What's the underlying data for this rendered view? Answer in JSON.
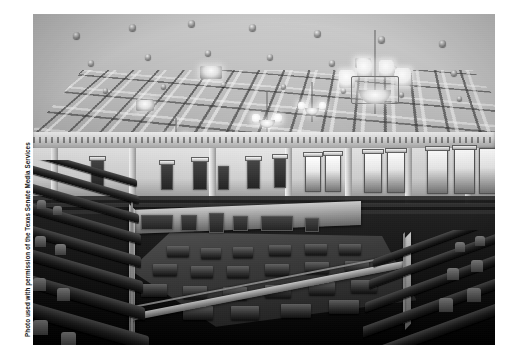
{
  "page": {
    "background_color": "#ffffff",
    "width": 518,
    "height": 362
  },
  "credit": {
    "text": "Photo used with permission of the Texas Senate Media Services",
    "orientation": "vertical-bottom-to-top",
    "color": "#1b1b1b"
  },
  "photo": {
    "alt": "Interior of the Texas Senate Chamber viewed from the upper gallery",
    "tone": "black-and-white",
    "frame": {
      "x": 33,
      "y": 14,
      "width": 462,
      "height": 331
    },
    "regions": [
      {
        "name": "coffered-ceiling",
        "description": "Deep coffered ceiling with ornamental beams and rosette bosses"
      },
      {
        "name": "chandeliers",
        "description": "Hanging chandeliers with frosted glass globes"
      },
      {
        "name": "upper-wall",
        "description": "Pale upper wall with arched windows and paneled doorways"
      },
      {
        "name": "back-gallery-tiers",
        "description": "Tiered gallery seating along the rear wall"
      },
      {
        "name": "senate-floor",
        "description": "Chamber well with rows of member desks"
      },
      {
        "name": "gallery-railing",
        "description": "Railing and parapet ringing the gallery"
      },
      {
        "name": "foreground-seating",
        "description": "Dark gallery seats in the foreground, left and right banks"
      }
    ]
  }
}
